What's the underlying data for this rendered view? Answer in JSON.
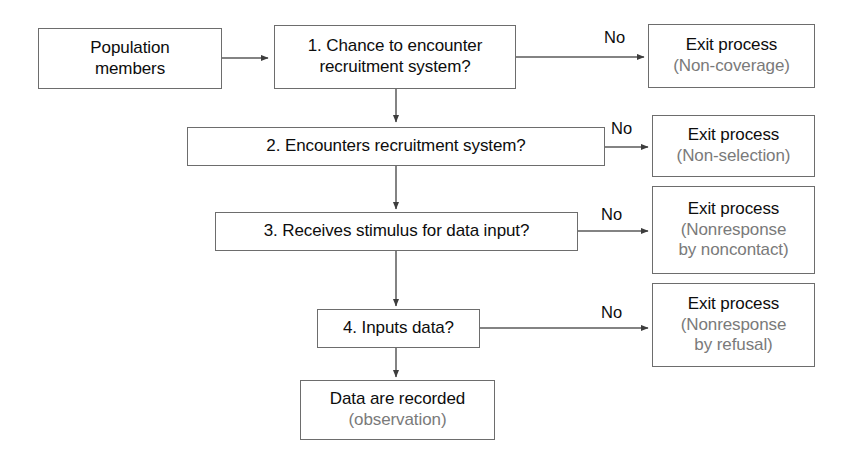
{
  "diagram": {
    "colors": {
      "box_border": "#6d6d6d",
      "primary_text": "#0d0d0d",
      "secondary_text": "#7a7a7a",
      "connector": "#555555",
      "background": "#ffffff"
    }
  },
  "nodes": {
    "population": {
      "line1": "Population",
      "line2": "members"
    },
    "step1": {
      "line1": "1. Chance to encounter",
      "line2": "recruitment system?"
    },
    "step2": {
      "line1": "2. Encounters recruitment system?"
    },
    "step3": {
      "line1": "3. Receives stimulus for data input?"
    },
    "step4": {
      "line1": "4. Inputs data?"
    },
    "exit1": {
      "line1": "Exit process",
      "line2": "(Non-coverage)"
    },
    "exit2": {
      "line1": "Exit process",
      "line2": "(Non-selection)"
    },
    "exit3": {
      "line1": "Exit process",
      "line2": "(Nonresponse",
      "line3": "by noncontact)"
    },
    "exit4": {
      "line1": "Exit process",
      "line2": "(Nonresponse",
      "line3": "by refusal)"
    },
    "outcome": {
      "line1": "Data are recorded",
      "line2": "(observation)"
    }
  },
  "edge_labels": {
    "no1": "No",
    "no2": "No",
    "no3": "No",
    "no4": "No"
  }
}
